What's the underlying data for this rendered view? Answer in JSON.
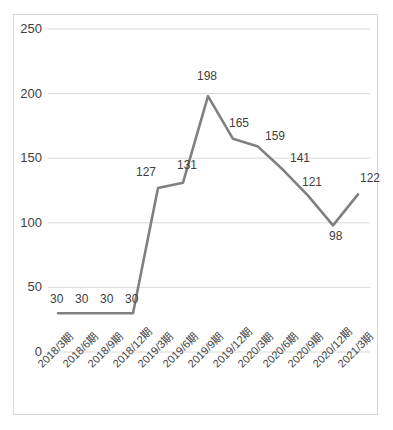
{
  "chart_data": {
    "type": "line",
    "title": "",
    "xlabel": "",
    "ylabel": "",
    "ylim": [
      0,
      250
    ],
    "yticks": [
      "0",
      "50",
      "100",
      "150",
      "200",
      "250"
    ],
    "ytick_values": [
      0,
      50,
      100,
      150,
      200,
      250
    ],
    "grid": true,
    "legend": "none",
    "line_color": "#808080",
    "grid_color": "#d9d9d9",
    "categories": [
      "2018/3期",
      "2018/6期",
      "2018/9期",
      "2018/12期",
      "2019/3期",
      "2019/6期",
      "2019/9期",
      "2019/12期",
      "2020/3期",
      "2020/6期",
      "2020/9期",
      "2020/12期",
      "2021/3期"
    ],
    "values": [
      30,
      30,
      30,
      30,
      127,
      131,
      198,
      165,
      159,
      141,
      121,
      98,
      122
    ],
    "data_labels": [
      "30",
      "30",
      "30",
      "30",
      "127",
      "131",
      "198",
      "165",
      "159",
      "141",
      "121",
      "98",
      "122"
    ]
  },
  "frame": {
    "border_color": "#d9d9d9"
  }
}
